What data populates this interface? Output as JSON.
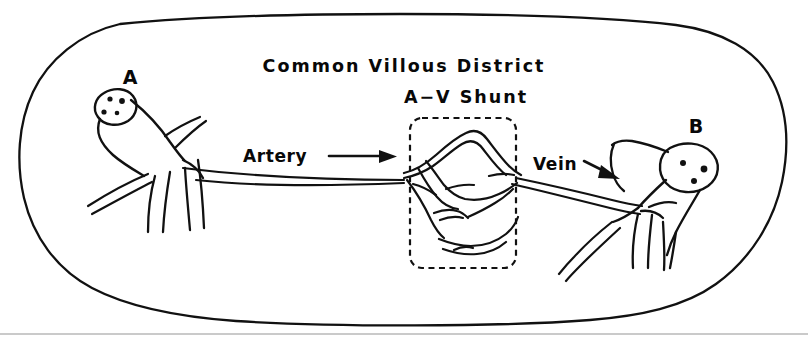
{
  "figure": {
    "kind": "anatomical-line-diagram",
    "background_color": "#ffffff",
    "ink_color": "#111111",
    "title": "Common Villous District",
    "subtitle": "A−V Shunt",
    "labels": {
      "node_a": "A",
      "node_b": "B",
      "artery": "Artery",
      "vein": "Vein"
    },
    "shunt_box": {
      "style": "dashed rounded rectangle",
      "contains": "capillary network"
    },
    "nodes": [
      {
        "id": "A",
        "label": "A",
        "side": "left",
        "dot_count": 4
      },
      {
        "id": "B",
        "label": "B",
        "side": "right",
        "dot_count": 3
      }
    ],
    "flow": [
      {
        "name": "artery",
        "label": "Artery",
        "direction": "right",
        "from": "A",
        "to": "A-V Shunt"
      },
      {
        "name": "vein",
        "label": "Vein",
        "direction": "right-down",
        "from": "A-V Shunt",
        "to": "B"
      }
    ]
  }
}
